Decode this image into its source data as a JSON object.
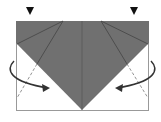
{
  "diagram": {
    "type": "origami-fold-step",
    "colors": {
      "paper_back": "#707070",
      "paper_front": "#ffffff",
      "line": "#444444",
      "arrow": "#333333"
    },
    "markers": [
      {
        "name": "push-marker-left",
        "x": 30,
        "y": 11
      },
      {
        "name": "push-marker-right",
        "x": 134,
        "y": 11
      }
    ],
    "arrows": [
      {
        "name": "fold-arrow-left",
        "direction": "inward-right"
      },
      {
        "name": "fold-arrow-right",
        "direction": "inward-left"
      }
    ]
  }
}
